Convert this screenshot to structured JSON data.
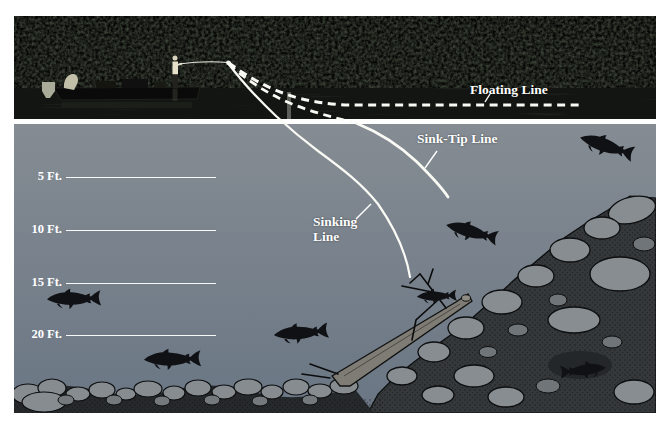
{
  "labels": {
    "floating": "Floating Line",
    "sink_tip": "Sink-Tip Line",
    "sinking_line1": "Sinking",
    "sinking_line2": "Line"
  },
  "depth_markers": [
    "5 Ft.",
    "10 Ft.",
    "15 Ft.",
    "20 Ft."
  ],
  "lines": [
    {
      "label": "Floating Line",
      "style": "dashed",
      "color": "#ffffff"
    },
    {
      "label": "Sink-Tip Line",
      "style": "dashed-then-solid",
      "color": "#ffffff"
    },
    {
      "label": "Sinking Line",
      "style": "solid",
      "color": "#ffffff"
    }
  ],
  "scene": {
    "fish_count": 7
  },
  "colors": {
    "water_top": "#858c93",
    "water_bottom": "#6a7684",
    "label_text": "#ffffff",
    "fish_silhouette": "#101114",
    "photo_background": "#070806",
    "rock_gray": "#878d91"
  }
}
